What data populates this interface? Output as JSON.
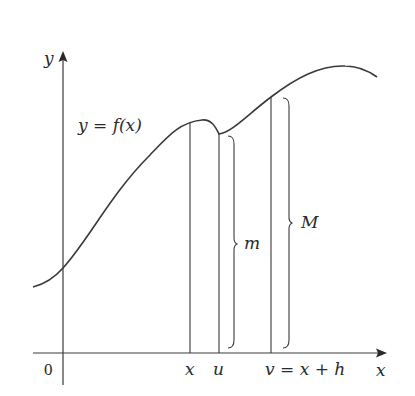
{
  "figure": {
    "axes": {
      "x_label": "x",
      "y_label": "y",
      "origin_label": "0"
    },
    "curve_label": "y = f(x)",
    "ticks": {
      "x": "x",
      "u": "u",
      "v": "v = x + h"
    },
    "braces": {
      "m": "m",
      "M": "M"
    },
    "colors": {
      "line": "#3a3a3a",
      "text": "#2a2a2a",
      "background": "#ffffff"
    }
  }
}
